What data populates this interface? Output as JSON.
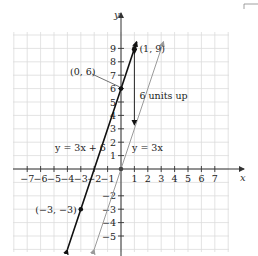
{
  "chart_data": {
    "type": "line",
    "title": "",
    "xlabel": "x",
    "ylabel": "y",
    "xlim": [
      -8,
      8
    ],
    "ylim": [
      -6,
      10
    ],
    "grid": true,
    "x_ticks": [
      -7,
      -6,
      -5,
      -4,
      -3,
      -2,
      -1,
      1,
      2,
      3,
      4,
      5,
      6,
      7
    ],
    "x_tick_labels": [
      "−7",
      "−6",
      "−5",
      "−4",
      "−3",
      "−2",
      "−1",
      "1",
      "2",
      "3",
      "4",
      "5",
      "6",
      "7"
    ],
    "y_ticks": [
      -5,
      -4,
      -3,
      -2,
      1,
      2,
      3,
      4,
      5,
      6,
      7,
      8,
      9
    ],
    "y_tick_labels": [
      "−5",
      "−4",
      "−3",
      "−2",
      "1",
      "2",
      "3",
      "4",
      "5",
      "6",
      "7",
      "8",
      "9"
    ],
    "series": [
      {
        "name": "y = 3x + 6",
        "slope": 3,
        "intercept": 6,
        "x": [
          -4,
          1.17
        ],
        "y": [
          -6,
          9.5
        ],
        "color": "#111111",
        "style": "solid-thick",
        "points": [
          {
            "x": -3,
            "y": -3,
            "label": "(−3, −3)"
          },
          {
            "x": 0,
            "y": 6,
            "label": "(0, 6)"
          },
          {
            "x": 1,
            "y": 9,
            "label": "(1, 9)"
          }
        ]
      },
      {
        "name": "y = 3x",
        "slope": 3,
        "intercept": 0,
        "x": [
          -2,
          3.17
        ],
        "y": [
          -6,
          9.5
        ],
        "color": "#9a9a9a",
        "style": "solid-thin",
        "points": [
          {
            "x": 0,
            "y": 0,
            "label": ""
          }
        ]
      }
    ],
    "annotations": [
      {
        "text": "(1, 9)",
        "x": 1,
        "y": 9
      },
      {
        "text": "(0, 6)",
        "x": 0,
        "y": 6
      },
      {
        "text": "6 units up",
        "x": 1,
        "y": 4.5,
        "arrow": "double vertical from (1,3) to (1,9)"
      },
      {
        "text": "y = 3x + 6",
        "x": -2,
        "y": 2
      },
      {
        "text": "y = 3x",
        "x": 1,
        "y": 2
      },
      {
        "text": "(−3, −3)",
        "x": -3,
        "y": -3
      }
    ]
  },
  "labels": {
    "x_axis": "x",
    "y_axis": "y",
    "point_1_9": "(1, 9)",
    "point_0_6": "(0, 6)",
    "point_m3_m3": "(−3, −3)",
    "shift_note": "6 units up",
    "line_shifted": "y = 3x + 6",
    "line_base": "y = 3x"
  },
  "colors": {
    "grid": "#dcdcdc",
    "axis": "#333333",
    "line_shifted": "#111111",
    "line_base": "#9a9a9a"
  }
}
